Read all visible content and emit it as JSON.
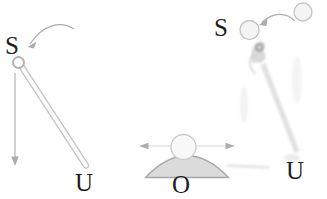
{
  "figure": {
    "background": "#ffffff"
  },
  "labels": {
    "left_pivot": "S",
    "left_end": "U",
    "middle_base": "O",
    "right_pivot": "S",
    "right_end": "U"
  },
  "colors": {
    "label_text": "#1e1e1e",
    "arrow_gray": "#adadad",
    "guide_line": "#d8d8d8",
    "rod_stroke": "#c6c6c6",
    "rod_fill": "#fbfbfb",
    "pivot_stroke": "#b3b3b3",
    "pivot_fill": "#ffffff",
    "ball_stroke": "#c9c9c9",
    "ball_fill": "#f8f8f8",
    "dome_fill": "#dbdbdb",
    "dome_stroke": "#a8a8a8",
    "ghost_circle_stroke": "#c5c5c5",
    "ghost_circle_fill": "#f4f4f4"
  }
}
